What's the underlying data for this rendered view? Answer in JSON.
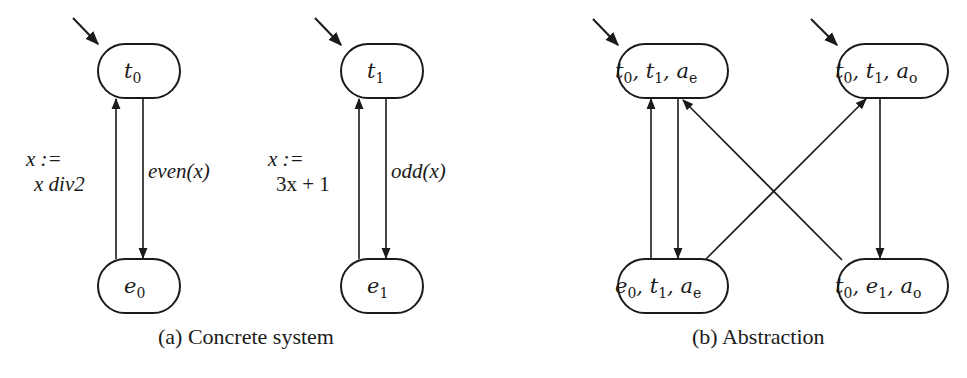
{
  "figure": {
    "panel_a": {
      "caption": "(a) Concrete system",
      "states": [
        {
          "id": "t0",
          "base": "t",
          "sub": "0",
          "initial": true
        },
        {
          "id": "e0",
          "base": "e",
          "sub": "0",
          "initial": false
        },
        {
          "id": "t1",
          "base": "t",
          "sub": "1",
          "initial": true
        },
        {
          "id": "e1",
          "base": "e",
          "sub": "1",
          "initial": false
        }
      ],
      "transitions": [
        {
          "from": "t0",
          "to": "e0",
          "label": "even(x)"
        },
        {
          "from": "e0",
          "to": "t0",
          "label_line1": "x :=",
          "label_line2": "x div2"
        },
        {
          "from": "t1",
          "to": "e1",
          "label": "odd(x)"
        },
        {
          "from": "e1",
          "to": "t1",
          "label_line1": "x :=",
          "label_line2": "3x + 1"
        }
      ]
    },
    "panel_b": {
      "caption": "(b) Abstraction",
      "states": [
        {
          "id": "s1",
          "parts": [
            {
              "b": "t",
              "s": "0"
            },
            {
              "b": "t",
              "s": "1"
            },
            {
              "b": "a",
              "s": "e"
            }
          ],
          "text": "t0, t1, ae",
          "initial": true
        },
        {
          "id": "s2",
          "parts": [
            {
              "b": "t",
              "s": "0"
            },
            {
              "b": "t",
              "s": "1"
            },
            {
              "b": "a",
              "s": "o"
            }
          ],
          "text": "t0, t1, ao",
          "initial": true
        },
        {
          "id": "s3",
          "parts": [
            {
              "b": "e",
              "s": "0"
            },
            {
              "b": "t",
              "s": "1"
            },
            {
              "b": "a",
              "s": "e"
            }
          ],
          "text": "e0, t1, ae",
          "initial": false
        },
        {
          "id": "s4",
          "parts": [
            {
              "b": "t",
              "s": "0"
            },
            {
              "b": "e",
              "s": "1"
            },
            {
              "b": "a",
              "s": "o"
            }
          ],
          "text": "t0, e1, ao",
          "initial": false
        }
      ],
      "transitions": [
        {
          "from": "s1",
          "to": "s3"
        },
        {
          "from": "s3",
          "to": "s1"
        },
        {
          "from": "s3",
          "to": "s2"
        },
        {
          "from": "s4",
          "to": "s1"
        },
        {
          "from": "s2",
          "to": "s4"
        }
      ]
    }
  }
}
